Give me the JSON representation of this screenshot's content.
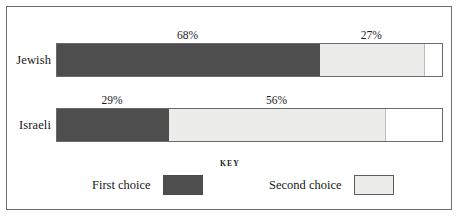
{
  "chart_data": {
    "type": "bar",
    "orientation": "horizontal",
    "stacked": true,
    "title": "",
    "xlabel": "",
    "ylabel": "",
    "xlim": [
      0,
      100
    ],
    "grid": false,
    "categories": [
      "Jewish",
      "Israeli"
    ],
    "series": [
      {
        "name": "First choice",
        "color": "#4e4e4e",
        "values": [
          68,
          29
        ],
        "labels": [
          "68%",
          "29%"
        ]
      },
      {
        "name": "Second choice",
        "color": "#ececea",
        "values": [
          27,
          56
        ],
        "labels": [
          "27%",
          "56%"
        ]
      }
    ],
    "legend": {
      "title": "KEY",
      "position": "bottom",
      "entries": [
        {
          "label": "First choice",
          "color": "#4e4e4e"
        },
        {
          "label": "Second choice",
          "color": "#ececea"
        }
      ]
    }
  },
  "rows": [
    {
      "category": "Jewish",
      "first": {
        "value": 68,
        "label": "68%"
      },
      "second": {
        "value": 27,
        "label": "27%"
      }
    },
    {
      "category": "Israeli",
      "first": {
        "value": 29,
        "label": "29%"
      },
      "second": {
        "value": 56,
        "label": "56%"
      }
    }
  ],
  "key": {
    "title": "KEY",
    "first_label": "First choice",
    "second_label": "Second choice"
  },
  "colors": {
    "first_choice": "#4e4e4e",
    "second_choice": "#ececea",
    "frame": "#6e6e72",
    "background": "#ffffff"
  }
}
